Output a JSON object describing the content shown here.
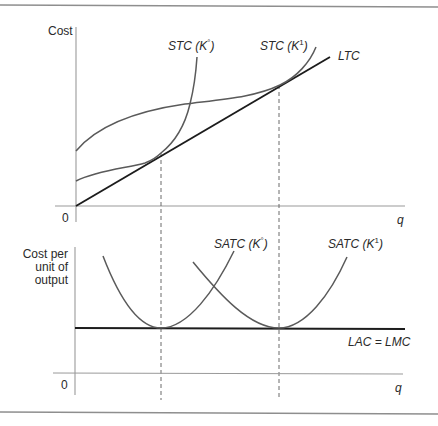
{
  "figure": {
    "top_panel": {
      "y_axis_label": "Cost",
      "x_axis_label": "q",
      "origin_label": "0",
      "curves": {
        "stc_k0": {
          "name": "STC",
          "arg_open": " (K",
          "sup": "°",
          "arg_close": ")"
        },
        "stc_k1": {
          "name": "STC",
          "arg_open": " (K",
          "sup": "1",
          "arg_close": ")"
        },
        "ltc": {
          "name": "LTC"
        }
      }
    },
    "bottom_panel": {
      "y_axis_label_lines": [
        "Cost per",
        "unit of",
        "output"
      ],
      "x_axis_label": "q",
      "origin_label": "0",
      "curves": {
        "satc_k0": {
          "name": "SATC",
          "arg_open": " (K",
          "sup": "°",
          "arg_close": ")"
        },
        "satc_k1": {
          "name": "SATC",
          "arg_open": " (K",
          "sup": "1",
          "arg_close": ")"
        },
        "lac_lmc": {
          "name": "LAC = LMC"
        }
      }
    },
    "colors": {
      "curve": "#5a5a5a",
      "bold_line": "#1c1c1c",
      "axis": "#9a9a9a"
    }
  }
}
